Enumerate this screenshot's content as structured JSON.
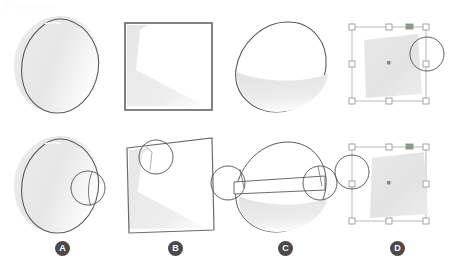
{
  "header": {
    "text": "図 7  形状編集の例"
  },
  "figure": {
    "rows": [
      {
        "name": "before-row",
        "label": "before"
      },
      {
        "name": "after-row",
        "label": "after"
      }
    ]
  },
  "colors": {
    "shape_outline": "#5a5a5a",
    "shape_fill_light": "#f2f2f2",
    "shape_fill_mid": "#e4e4e4",
    "shape_fill_dark": "#d8d8d8",
    "square_outline": "#6b6b6b",
    "magnifier_stroke": "#4f4f4f",
    "selection_line": "#b9b9b9",
    "selection_handle_fill": "#ffffff",
    "selection_handle_stroke": "#9a9a9a",
    "rotation_handle": "#8f9b8f",
    "center_marker": "#8a8a8a",
    "badge_bg": "#4a4a4a",
    "badge_text": "#ffffff",
    "header_text": "#fbfbfb",
    "background": "#ffffff"
  },
  "panels": [
    {
      "id": "A",
      "badge_label": "A",
      "badge_x": 55,
      "shape": "leaf-ellipse",
      "description": "Leaf shaped closed curve with crescent gradient fill",
      "top": {
        "has_magnifier": false
      },
      "bottom": {
        "has_magnifier": true,
        "magnifier_count": 1,
        "magnifier_side": "right"
      }
    },
    {
      "id": "B",
      "badge_label": "B",
      "badge_x": 168,
      "shape": "square-wedge",
      "description": "Square frame containing an L shaped wedge gradient",
      "top": {
        "has_magnifier": false
      },
      "bottom": {
        "has_magnifier": true,
        "magnifier_count": 1,
        "magnifier_side": "upper-left"
      }
    },
    {
      "id": "C",
      "badge_label": "C",
      "badge_x": 278,
      "shape": "ellipse-band",
      "description": "Ellipse outline with lower gradient fill and horizontal band",
      "top": {
        "has_magnifier": false
      },
      "bottom": {
        "has_magnifier": true,
        "magnifier_count": 2,
        "magnifier_side": "left-and-right"
      }
    },
    {
      "id": "D",
      "badge_label": "D",
      "badge_x": 390,
      "shape": "selection-box",
      "description": "Selection bounding box with eight handles, rotation handle and center marker around a gray quadrilateral",
      "top": {
        "has_magnifier": true,
        "magnifier_count": 1,
        "magnifier_side": "right"
      },
      "bottom": {
        "has_magnifier": true,
        "magnifier_count": 1,
        "magnifier_side": "left"
      }
    }
  ],
  "badges": {
    "items": [
      {
        "label": "A"
      },
      {
        "label": "B"
      },
      {
        "label": "C"
      },
      {
        "label": "D"
      }
    ]
  }
}
